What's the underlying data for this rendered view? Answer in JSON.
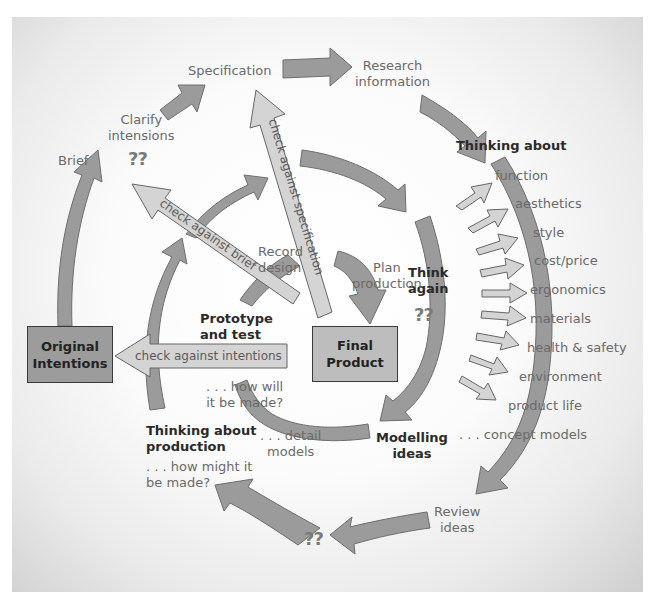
{
  "diagram": {
    "boxes": {
      "original": "Original\nIntentions",
      "final": "Final\nProduct"
    },
    "check_arrows": {
      "specification": "check against specification",
      "brief": "check against brief",
      "intentions": "check against intentions"
    },
    "stages": {
      "brief": "Brief",
      "clarify": "Clarify\nintensions",
      "specification": "Specification",
      "research": "Research\ninformation",
      "thinking_about": "Thinking about",
      "think_again": "Think\nagain",
      "modelling": "Modelling\nideas",
      "review": "Review\nideas",
      "thinking_production": "Thinking about\nproduction",
      "how_might": ". . . how might it\nbe made?",
      "detail_models": ". . . detail\nmodels",
      "prototype": "Prototype\nand test",
      "how_will": ". . . how will\nit be made?",
      "record": "Record\ndesign",
      "plan": "Plan\nproduction",
      "concept_models": ". . . concept models"
    },
    "question_marks": {
      "clarify": "??",
      "think_again": "??",
      "review": "??"
    },
    "considerations": [
      "function",
      "aesthetics",
      "style",
      "cost/price",
      "ergonomics",
      "materials",
      "health & safety",
      "environment",
      "product life"
    ],
    "colors": {
      "dark_arrow": "#9b9b9b",
      "light_arrow": "#d2d2d2",
      "outline": "#555555",
      "box": "#9c9c9c"
    }
  }
}
